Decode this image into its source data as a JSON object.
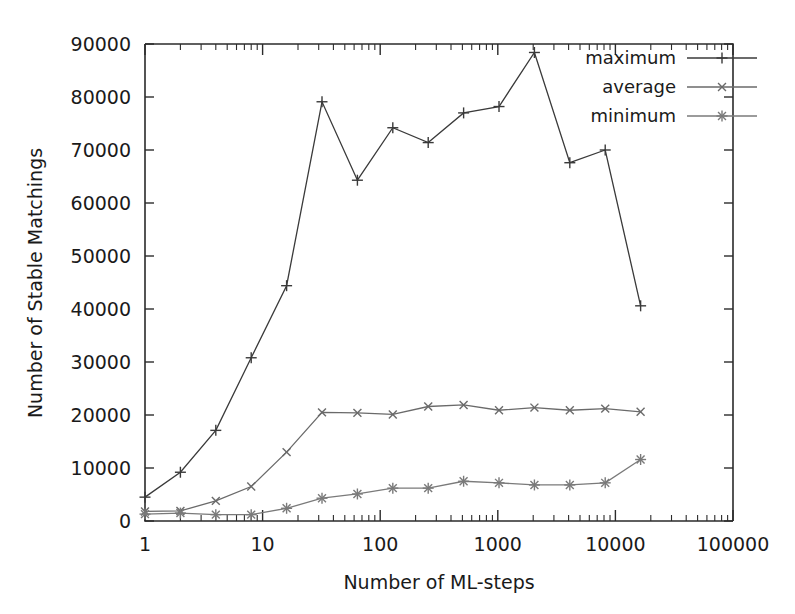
{
  "chart_data": {
    "type": "line",
    "title": "",
    "xlabel": "Number of ML-steps",
    "ylabel": "Number of Stable Matchings",
    "xscale": "log",
    "yscale": "linear",
    "xlim": [
      1,
      100000
    ],
    "ylim": [
      0,
      90000
    ],
    "grid": false,
    "legend_position": "top-right",
    "x": [
      1,
      2,
      4,
      8,
      16,
      32,
      64,
      128,
      256,
      512,
      1024,
      2048,
      4096,
      8192,
      16384
    ],
    "series": [
      {
        "name": "maximum",
        "marker": "plus",
        "color": "#3a3a3a",
        "values": [
          4500,
          9200,
          17100,
          30800,
          44400,
          79100,
          64300,
          74200,
          71400,
          77000,
          78200,
          88400,
          67600,
          70000,
          40600
        ]
      },
      {
        "name": "average",
        "marker": "cross",
        "color": "#6a6a6a",
        "values": [
          1800,
          1900,
          3800,
          6500,
          13000,
          20500,
          20400,
          20100,
          21600,
          21900,
          20900,
          21400,
          20900,
          21200,
          20600
        ]
      },
      {
        "name": "minimum",
        "marker": "star",
        "color": "#7a7a7a",
        "values": [
          1300,
          1500,
          1200,
          1200,
          2400,
          4300,
          5100,
          6200,
          6200,
          7500,
          7200,
          6800,
          6800,
          7200,
          11600
        ]
      }
    ],
    "x_tick_labels": [
      "1",
      "10",
      "100",
      "1000",
      "10000",
      "100000"
    ],
    "x_tick_values": [
      1,
      10,
      100,
      1000,
      10000,
      100000
    ],
    "y_tick_labels": [
      "0",
      "10000",
      "20000",
      "30000",
      "40000",
      "50000",
      "60000",
      "70000",
      "80000",
      "90000"
    ],
    "y_tick_values": [
      0,
      10000,
      20000,
      30000,
      40000,
      50000,
      60000,
      70000,
      80000,
      90000
    ]
  },
  "legend": {
    "entries": [
      {
        "label": "maximum"
      },
      {
        "label": "average"
      },
      {
        "label": "minimum"
      }
    ]
  }
}
